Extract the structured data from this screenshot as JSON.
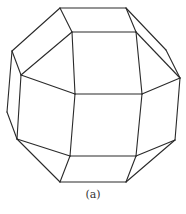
{
  "figure": {
    "caption": "(a)",
    "line_color": "#2a2a2a",
    "vertices": {
      "t1": [
        60,
        8
      ],
      "t2": [
        126,
        8
      ],
      "u1": [
        72,
        32
      ],
      "u2": [
        136,
        32
      ],
      "l1": [
        12,
        51
      ],
      "l2": [
        21,
        75
      ],
      "r1": [
        166,
        50
      ],
      "r2": [
        180,
        78
      ],
      "m1": [
        75,
        94
      ],
      "m2": [
        142,
        94
      ],
      "l3": [
        7,
        112
      ],
      "l4": [
        17,
        139
      ],
      "b1": [
        70,
        156
      ],
      "b2": [
        136,
        156
      ],
      "r3": [
        175,
        140
      ],
      "d1": [
        60,
        182
      ],
      "d2": [
        126,
        182
      ]
    },
    "edges": [
      [
        "t1",
        "t2"
      ],
      [
        "t1",
        "u1"
      ],
      [
        "t2",
        "u2"
      ],
      [
        "u1",
        "u2"
      ],
      [
        "t1",
        "l1"
      ],
      [
        "l1",
        "l2"
      ],
      [
        "u1",
        "l2"
      ],
      [
        "t2",
        "r1"
      ],
      [
        "r1",
        "r2"
      ],
      [
        "u2",
        "r2"
      ],
      [
        "l2",
        "m1"
      ],
      [
        "u1",
        "m1"
      ],
      [
        "u2",
        "m2"
      ],
      [
        "m1",
        "m2"
      ],
      [
        "m2",
        "r2"
      ],
      [
        "l1",
        "l3"
      ],
      [
        "l3",
        "l4"
      ],
      [
        "l2",
        "l4"
      ],
      [
        "m1",
        "b1"
      ],
      [
        "m2",
        "b2"
      ],
      [
        "b1",
        "b2"
      ],
      [
        "l4",
        "b1"
      ],
      [
        "l4",
        "d1"
      ],
      [
        "b1",
        "d1"
      ],
      [
        "d1",
        "d2"
      ],
      [
        "b2",
        "d2"
      ],
      [
        "r2",
        "r3"
      ],
      [
        "b2",
        "r3"
      ],
      [
        "d2",
        "r3"
      ]
    ]
  }
}
